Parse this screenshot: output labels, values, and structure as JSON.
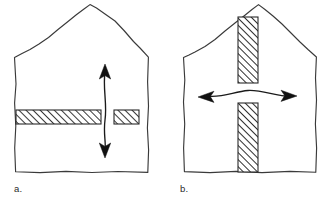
{
  "figure": {
    "background_color": "#ffffff",
    "ink_color": "#3a3a3a",
    "hatch_color": "#2b2b2b",
    "arrow_color": "#111111",
    "style": "hand-drawn sketch",
    "panels": [
      {
        "id": "a",
        "label": "a.",
        "label_x": 14,
        "label_y": 192,
        "house": {
          "name": "house-outline-a",
          "apex_x": 78,
          "apex_y": 5,
          "eave_left_x": 14,
          "eave_right_x": 148,
          "eave_y": 57,
          "base_y": 172
        },
        "elements": [
          {
            "name": "horizontal-wall-long",
            "kind": "hatched-bar",
            "orientation": "horizontal",
            "x": 16,
            "y": 110,
            "width": 85,
            "height": 14,
            "hatch": "diagonal-45"
          },
          {
            "name": "horizontal-wall-short",
            "kind": "hatched-bar",
            "orientation": "horizontal",
            "x": 114,
            "y": 110,
            "width": 25,
            "height": 14,
            "hatch": "diagonal-45"
          },
          {
            "name": "vertical-double-arrow",
            "kind": "double-arrow",
            "orientation": "vertical",
            "x": 105,
            "y_top": 66,
            "y_bottom": 156
          }
        ]
      },
      {
        "id": "b",
        "label": "b.",
        "label_x": 180,
        "label_y": 192,
        "house": {
          "name": "house-outline-b",
          "apex_x": 253,
          "apex_y": 5,
          "eave_left_x": 183,
          "eave_right_x": 316,
          "eave_y": 57,
          "base_y": 172
        },
        "elements": [
          {
            "name": "vertical-wall-upper",
            "kind": "hatched-bar",
            "orientation": "vertical",
            "x": 238,
            "y": 17,
            "width": 20,
            "height": 66,
            "hatch": "diagonal-45"
          },
          {
            "name": "vertical-wall-lower",
            "kind": "hatched-bar",
            "orientation": "vertical",
            "x": 238,
            "y": 103,
            "width": 20,
            "height": 69,
            "hatch": "diagonal-45"
          },
          {
            "name": "horizontal-double-arrow",
            "kind": "double-arrow",
            "orientation": "horizontal",
            "y": 96,
            "x_left": 199,
            "x_right": 296
          }
        ]
      }
    ]
  }
}
